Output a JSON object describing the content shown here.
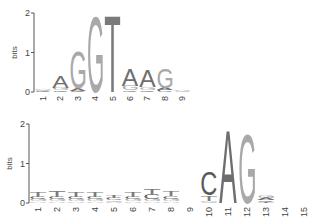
{
  "chart_data": [
    {
      "type": "sequence-logo",
      "title": "",
      "ylabel": "bits",
      "ylim": [
        0,
        2
      ],
      "yticks": [
        "0",
        "1",
        "2"
      ],
      "xlabel": "",
      "positions": [
        "1",
        "2",
        "3",
        "4",
        "5",
        "6",
        "7",
        "8",
        "9"
      ],
      "stacks": [
        [
          {
            "letter": "C",
            "bits": 0.03
          },
          {
            "letter": "G",
            "bits": 0.03
          },
          {
            "letter": "A",
            "bits": 0.04
          }
        ],
        [
          {
            "letter": "C",
            "bits": 0.04
          },
          {
            "letter": "G",
            "bits": 0.05
          },
          {
            "letter": "A",
            "bits": 0.3
          }
        ],
        [
          {
            "letter": "C",
            "bits": 0.03
          },
          {
            "letter": "A",
            "bits": 0.06
          },
          {
            "letter": "G",
            "bits": 0.95
          }
        ],
        [
          {
            "letter": "G",
            "bits": 1.95
          }
        ],
        [
          {
            "letter": "T",
            "bits": 1.98
          }
        ],
        [
          {
            "letter": "C",
            "bits": 0.04
          },
          {
            "letter": "G",
            "bits": 0.12
          },
          {
            "letter": "A",
            "bits": 0.45
          }
        ],
        [
          {
            "letter": "C",
            "bits": 0.04
          },
          {
            "letter": "G",
            "bits": 0.08
          },
          {
            "letter": "A",
            "bits": 0.45
          }
        ],
        [
          {
            "letter": "C",
            "bits": 0.05
          },
          {
            "letter": "A",
            "bits": 0.06
          },
          {
            "letter": "G",
            "bits": 0.5
          }
        ],
        [
          {
            "letter": "G",
            "bits": 0.02
          },
          {
            "letter": "A",
            "bits": 0.02
          }
        ]
      ]
    },
    {
      "type": "sequence-logo",
      "title": "",
      "ylabel": "bits",
      "ylim": [
        0,
        2
      ],
      "yticks": [
        "0",
        "1",
        "2"
      ],
      "xlabel": "",
      "positions": [
        "1",
        "2",
        "3",
        "4",
        "5",
        "6",
        "7",
        "8",
        "9",
        "10",
        "11",
        "12",
        "13",
        "14",
        "15"
      ],
      "stacks": [
        [
          {
            "letter": "A",
            "bits": 0.04
          },
          {
            "letter": "G",
            "bits": 0.06
          },
          {
            "letter": "C",
            "bits": 0.06
          },
          {
            "letter": "T",
            "bits": 0.14
          }
        ],
        [
          {
            "letter": "A",
            "bits": 0.04
          },
          {
            "letter": "G",
            "bits": 0.06
          },
          {
            "letter": "C",
            "bits": 0.06
          },
          {
            "letter": "T",
            "bits": 0.18
          }
        ],
        [
          {
            "letter": "A",
            "bits": 0.04
          },
          {
            "letter": "G",
            "bits": 0.05
          },
          {
            "letter": "C",
            "bits": 0.06
          },
          {
            "letter": "T",
            "bits": 0.13
          }
        ],
        [
          {
            "letter": "A",
            "bits": 0.04
          },
          {
            "letter": "G",
            "bits": 0.05
          },
          {
            "letter": "C",
            "bits": 0.06
          },
          {
            "letter": "T",
            "bits": 0.12
          }
        ],
        [
          {
            "letter": "A",
            "bits": 0.03
          },
          {
            "letter": "G",
            "bits": 0.04
          },
          {
            "letter": "C",
            "bits": 0.06
          },
          {
            "letter": "T",
            "bits": 0.07
          }
        ],
        [
          {
            "letter": "A",
            "bits": 0.04
          },
          {
            "letter": "G",
            "bits": 0.05
          },
          {
            "letter": "C",
            "bits": 0.06
          },
          {
            "letter": "T",
            "bits": 0.12
          }
        ],
        [
          {
            "letter": "A",
            "bits": 0.04
          },
          {
            "letter": "G",
            "bits": 0.05
          },
          {
            "letter": "C",
            "bits": 0.12
          },
          {
            "letter": "T",
            "bits": 0.15
          }
        ],
        [
          {
            "letter": "A",
            "bits": 0.04
          },
          {
            "letter": "G",
            "bits": 0.05
          },
          {
            "letter": "C",
            "bits": 0.08
          },
          {
            "letter": "T",
            "bits": 0.14
          }
        ],
        [],
        [
          {
            "letter": "G",
            "bits": 0.02
          },
          {
            "letter": "A",
            "bits": 0.03
          },
          {
            "letter": "T",
            "bits": 0.14
          },
          {
            "letter": "C",
            "bits": 0.62
          }
        ],
        [
          {
            "letter": "A",
            "bits": 1.9
          }
        ],
        [
          {
            "letter": "G",
            "bits": 1.8
          }
        ],
        [
          {
            "letter": "T",
            "bits": 0.03
          },
          {
            "letter": "C",
            "bits": 0.04
          },
          {
            "letter": "A",
            "bits": 0.06
          },
          {
            "letter": "G",
            "bits": 0.06
          }
        ],
        [],
        []
      ]
    }
  ],
  "colors": {
    "A": "#6e6e6e",
    "C": "#5a5a5a",
    "G": "#a9a9a9",
    "T": "#7a7a7a",
    "axis": "#555555"
  }
}
